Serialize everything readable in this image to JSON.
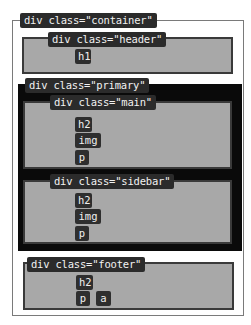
{
  "diagram": {
    "container": {
      "label": "div class=\"container\""
    },
    "header": {
      "label": "div class=\"header\"",
      "children": [
        "h1"
      ]
    },
    "primary": {
      "label": "div class=\"primary\"",
      "main": {
        "label": "div class=\"main\"",
        "children": [
          "h2",
          "img",
          "p"
        ]
      },
      "sidebar": {
        "label": "div class=\"sidebar\"",
        "children": [
          "h2",
          "img",
          "p"
        ]
      }
    },
    "footer": {
      "label": "div class=\"footer\"",
      "children": [
        "h2",
        "p",
        "a"
      ]
    }
  },
  "colors": {
    "label_bg": "#2b2b2b",
    "box_gray": "#a8a8a8",
    "primary_black": "#0a0a0a",
    "outline": "#7a7a7a"
  }
}
